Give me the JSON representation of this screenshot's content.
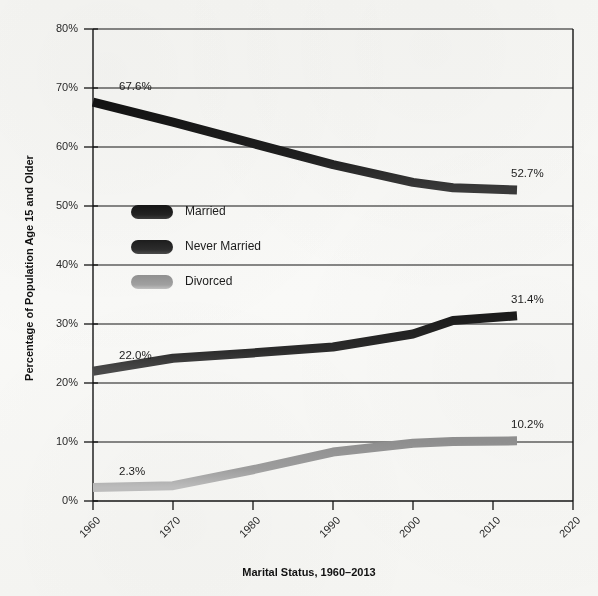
{
  "chart_data": {
    "type": "line",
    "title": "",
    "xlabel": "Marital Status, 1960–2013",
    "ylabel": "Percentage of Population Age 15 and Older",
    "xlim": [
      1960,
      2020
    ],
    "ylim": [
      0,
      80
    ],
    "xticks": [
      "1960",
      "1970",
      "1980",
      "1990",
      "2000",
      "2010",
      "2020"
    ],
    "yticks": [
      "0%",
      "10%",
      "20%",
      "30%",
      "40%",
      "50%",
      "60%",
      "70%",
      "80%"
    ],
    "grid": "horizontal",
    "legend_position": "inside-left",
    "x": [
      1960,
      1970,
      1980,
      1990,
      2000,
      2005,
      2013
    ],
    "series": [
      {
        "name": "Married",
        "color": "#1c1c1c",
        "values": [
          67.6,
          64.2,
          60.6,
          57.0,
          54.0,
          53.1,
          52.7
        ],
        "start_label": "67.6%",
        "end_label": "52.7%"
      },
      {
        "name": "Never Married",
        "color": "#2e2e2e",
        "values": [
          22.0,
          24.2,
          25.1,
          26.1,
          28.3,
          30.6,
          31.4
        ],
        "start_label": "22.0%",
        "end_label": "31.4%"
      },
      {
        "name": "Divorced",
        "color": "#9a9a9a",
        "values": [
          2.3,
          2.6,
          5.3,
          8.3,
          9.8,
          10.1,
          10.2
        ],
        "start_label": "2.3%",
        "end_label": "10.2%"
      }
    ],
    "annotations": [
      {
        "text": "67.6%",
        "series": "Married",
        "position": "start"
      },
      {
        "text": "52.7%",
        "series": "Married",
        "position": "end"
      },
      {
        "text": "22.0%",
        "series": "Never Married",
        "position": "start"
      },
      {
        "text": "31.4%",
        "series": "Never Married",
        "position": "end"
      },
      {
        "text": "2.3%",
        "series": "Divorced",
        "position": "start"
      },
      {
        "text": "10.2%",
        "series": "Divorced",
        "position": "end"
      }
    ]
  },
  "legend": {
    "items": [
      {
        "label": "Married",
        "color": "#1c1c1c"
      },
      {
        "label": "Never Married",
        "color": "#2e2e2e"
      },
      {
        "label": "Divorced",
        "color": "#9a9a9a"
      }
    ]
  },
  "axes": {
    "y_title": "Percentage of Population Age 15 and Older",
    "x_title": "Marital Status, 1960–2013"
  }
}
